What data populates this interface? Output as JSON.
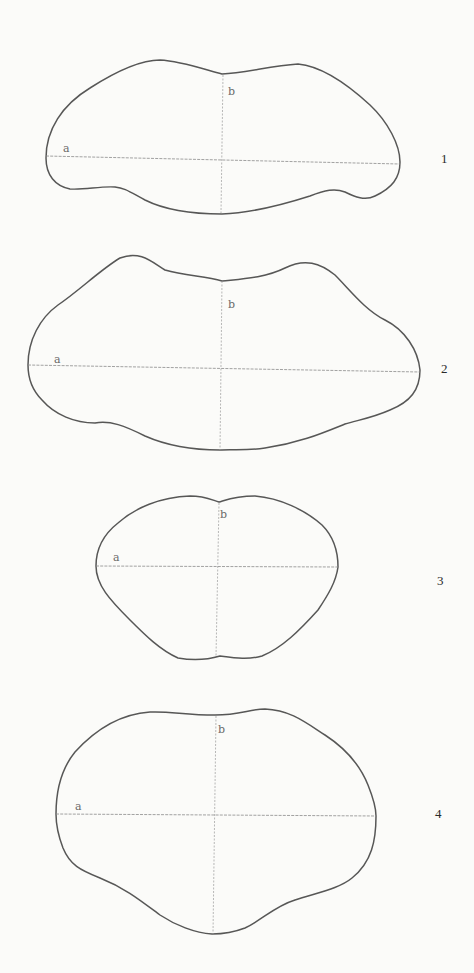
{
  "plate": {
    "background_color": "#fbfbf9",
    "outline_color": "#3a3a3a",
    "axis_color": "#8a8a8a"
  },
  "figures": [
    {
      "number": "1",
      "label_a": "a",
      "label_b": "b",
      "outline_path": "M 46 158 C 46 130, 62 105, 90 88 C 115 72, 140 60, 160 60 C 180 61, 200 68, 222 74 C 245 73, 270 66, 298 64 C 320 66, 345 82, 370 105 C 388 122, 400 145, 400 162 C 400 178, 392 188, 375 196 C 365 201, 355 197, 345 192 C 335 188, 325 190, 310 196 C 285 204, 250 213, 222 214 C 195 214, 165 210, 145 200 C 130 192, 125 188, 115 187 C 100 186, 85 190, 70 189 C 55 186, 46 175, 46 158 Z",
      "axis_a": {
        "x1": 46,
        "y1": 156,
        "x2": 400,
        "y2": 164
      },
      "axis_b": {
        "x1": 223,
        "y1": 75,
        "x2": 221,
        "y2": 213
      },
      "label_a_pos": {
        "x": 63,
        "y": 143
      },
      "label_b_pos": {
        "x": 228,
        "y": 86
      },
      "number_pos": {
        "x": 441,
        "y": 152
      }
    },
    {
      "number": "2",
      "label_a": "a",
      "label_b": "b",
      "outline_path": "M 28 365 C 28 340, 40 318, 58 305 C 80 290, 100 270, 120 258 C 140 250, 152 262, 165 270 C 185 276, 205 276, 222 281 C 240 279, 265 278, 285 268 C 305 258, 320 263, 335 275 C 350 290, 365 310, 385 320 C 405 330, 418 350, 420 370 C 420 390, 410 402, 390 410 C 372 418, 358 420, 345 424 C 325 432, 300 443, 265 448 C 245 451, 230 449, 220 450 C 200 450, 170 447, 145 436 C 125 426, 110 420, 95 423 C 75 423, 55 415, 42 400 C 32 390, 28 378, 28 365 Z",
      "axis_a": {
        "x1": 28,
        "y1": 365,
        "x2": 420,
        "y2": 372
      },
      "axis_b": {
        "x1": 222,
        "y1": 281,
        "x2": 220,
        "y2": 450
      },
      "label_a_pos": {
        "x": 54,
        "y": 354
      },
      "label_b_pos": {
        "x": 228,
        "y": 299
      },
      "number_pos": {
        "x": 441,
        "y": 362
      }
    },
    {
      "number": "3",
      "label_a": "a",
      "label_b": "b",
      "outline_path": "M 96 566 C 96 548, 104 534, 118 523 C 135 508, 160 497, 190 496 C 205 496, 212 500, 219 502 C 226 500, 235 496, 255 496 C 280 498, 305 510, 322 525 C 334 537, 338 552, 338 567 C 336 582, 328 595, 318 610 C 300 630, 282 648, 262 656 C 248 660, 235 658, 220 656 C 210 659, 195 661, 178 658 C 160 650, 145 635, 130 620 C 110 600, 96 585, 96 566 Z",
      "axis_a": {
        "x1": 96,
        "y1": 566,
        "x2": 338,
        "y2": 567
      },
      "axis_b": {
        "x1": 219,
        "y1": 503,
        "x2": 216,
        "y2": 657
      },
      "label_a_pos": {
        "x": 113,
        "y": 552
      },
      "label_b_pos": {
        "x": 220,
        "y": 509
      },
      "number_pos": {
        "x": 437,
        "y": 574
      }
    },
    {
      "number": "4",
      "label_a": "a",
      "label_b": "b",
      "outline_path": "M 56 814 C 56 788, 62 768, 75 752 C 95 730, 120 714, 150 712 C 170 711, 185 715, 215 715 C 240 715, 250 709, 265 709 C 290 710, 305 722, 325 735 C 345 748, 360 765, 368 785 C 374 800, 376 808, 376 816 C 376 840, 372 862, 352 878 C 340 888, 320 892, 295 900 C 275 906, 262 920, 245 928 C 232 933, 220 934, 212 934 C 195 933, 175 925, 160 915 C 140 900, 125 888, 100 878 C 80 870, 70 865, 63 848 C 58 835, 56 825, 56 814 Z",
      "axis_a": {
        "x1": 56,
        "y1": 814,
        "x2": 376,
        "y2": 816
      },
      "axis_b": {
        "x1": 216,
        "y1": 716,
        "x2": 213,
        "y2": 934
      },
      "label_a_pos": {
        "x": 75,
        "y": 801
      },
      "label_b_pos": {
        "x": 218,
        "y": 724
      },
      "number_pos": {
        "x": 435,
        "y": 807
      }
    }
  ]
}
